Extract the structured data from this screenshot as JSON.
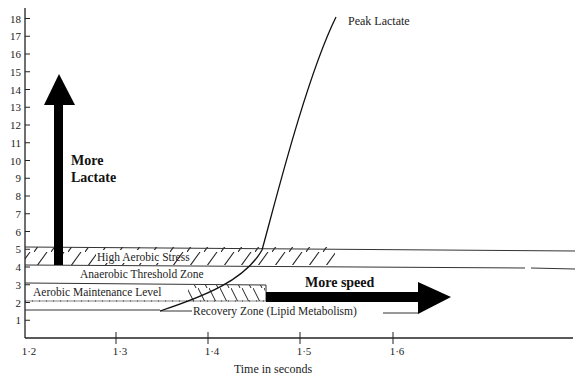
{
  "chart_data": {
    "type": "line",
    "title": "",
    "xlabel": "Time in seconds",
    "ylabel": "",
    "xlim": [
      1.2,
      1.75
    ],
    "ylim": [
      0,
      18
    ],
    "x_ticks": [
      "1·2",
      "1·3",
      "1·4",
      "1·5",
      "1·6"
    ],
    "y_ticks": [
      "1",
      "2",
      "3",
      "4",
      "5",
      "6",
      "7",
      "8",
      "9",
      "10",
      "11",
      "12",
      "13",
      "14",
      "15",
      "16",
      "17",
      "18"
    ],
    "grid": false,
    "legend": null,
    "series": [
      {
        "name": "Peak Lactate",
        "x": [
          1.33,
          1.37,
          1.4,
          1.42,
          1.43,
          1.45,
          1.47,
          1.5
        ],
        "y": [
          1.5,
          2.3,
          3.2,
          4.2,
          5.0,
          9.0,
          13.5,
          17.8
        ]
      }
    ],
    "zones": [
      {
        "name": "High Aerobic Stress",
        "y_range": [
          4,
          5
        ],
        "hatched_x_range": [
          1.2,
          1.5
        ],
        "x_end": 1.75
      },
      {
        "name": "Anaerobic Threshold Zone",
        "y_range": [
          3,
          4
        ],
        "x_end": 1.75
      },
      {
        "name": "Aerobic Maintenance Level",
        "y_range": [
          2,
          3
        ],
        "hatched_x_range": [
          1.37,
          1.43
        ],
        "x_end": 1.43
      },
      {
        "name": "Recovery Zone (Lipid Metabolism)",
        "y_value": 1.5,
        "x_end": 1.58
      }
    ],
    "annotations": [
      {
        "text": "Peak Lactate",
        "x": 1.51,
        "y": 17.5
      },
      {
        "text": "More Lactate",
        "type": "arrow-up",
        "x": 1.23,
        "y_from": 4,
        "y_to": 15
      },
      {
        "text": "More speed",
        "type": "arrow-right",
        "y": 2.3,
        "x_from": 1.43,
        "x_to": 1.6
      }
    ]
  },
  "labels": {
    "peak_lactate": "Peak Lactate",
    "more": "More",
    "lactate": "Lactate",
    "more_speed": "More speed",
    "high_aerobic_stress": "High Aerobic Stress",
    "anaerobic_threshold": "Anaerobic Threshold Zone",
    "aerobic_maintenance": "Aerobic Maintenance Level",
    "recovery_zone": "Recovery Zone (Lipid Metabolism)",
    "x_axis_title": "Time in seconds"
  },
  "x_ticks": [
    "1·2",
    "1·3",
    "1·4",
    "1·5",
    "1·6"
  ],
  "y_ticks": [
    "1",
    "2",
    "3",
    "4",
    "5",
    "6",
    "7",
    "8",
    "9",
    "10",
    "11",
    "12",
    "13",
    "14",
    "15",
    "16",
    "17",
    "18"
  ]
}
